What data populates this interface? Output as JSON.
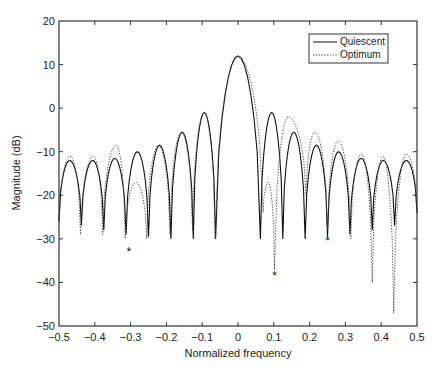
{
  "chart_data": {
    "type": "line",
    "title": "",
    "xlabel": "Normalized frequency",
    "ylabel": "Magnitude (dB)",
    "xlim": [
      -0.5,
      0.5
    ],
    "ylim": [
      -50,
      20
    ],
    "grid": false,
    "legend_position": "upper right",
    "xticks": [
      "−0.5",
      "−0.4",
      "−0.3",
      "−0.2",
      "−0.1",
      "0",
      "0.1",
      "0.2",
      "0.3",
      "0.4",
      "0.5"
    ],
    "yticks": [
      "20",
      "10",
      "0",
      "−10",
      "−20",
      "−30",
      "−40",
      "−50"
    ],
    "series": [
      {
        "name": "Quiescent",
        "style": "solid",
        "nulls": [
          {
            "x": -0.4375,
            "y": -27
          },
          {
            "x": -0.375,
            "y": -28
          },
          {
            "x": -0.3125,
            "y": -29
          },
          {
            "x": -0.25,
            "y": -29.5
          },
          {
            "x": -0.1875,
            "y": -30
          },
          {
            "x": -0.125,
            "y": -30
          },
          {
            "x": -0.0625,
            "y": -30
          },
          {
            "x": 0.0625,
            "y": -30
          },
          {
            "x": 0.125,
            "y": -30
          },
          {
            "x": 0.1875,
            "y": -30
          },
          {
            "x": 0.25,
            "y": -29.5
          },
          {
            "x": 0.3125,
            "y": -29
          },
          {
            "x": 0.375,
            "y": -28
          },
          {
            "x": 0.4375,
            "y": -27
          }
        ],
        "peaks": [
          {
            "x": -0.47,
            "y": -12
          },
          {
            "x": -0.406,
            "y": -12
          },
          {
            "x": -0.344,
            "y": -11.5
          },
          {
            "x": -0.281,
            "y": -10
          },
          {
            "x": -0.219,
            "y": -8.5
          },
          {
            "x": -0.156,
            "y": -5.5
          },
          {
            "x": -0.094,
            "y": -1
          },
          {
            "x": 0.0,
            "y": 12
          },
          {
            "x": 0.094,
            "y": -1
          },
          {
            "x": 0.156,
            "y": -5.5
          },
          {
            "x": 0.219,
            "y": -8.5
          },
          {
            "x": 0.281,
            "y": -10
          },
          {
            "x": 0.344,
            "y": -11.5
          },
          {
            "x": 0.406,
            "y": -12
          },
          {
            "x": 0.47,
            "y": -12
          }
        ]
      },
      {
        "name": "Optimum",
        "style": "dotted",
        "nulls": [
          {
            "x": -0.44,
            "y": -29
          },
          {
            "x": -0.378,
            "y": -29
          },
          {
            "x": -0.315,
            "y": -30
          },
          {
            "x": -0.255,
            "y": -30
          },
          {
            "x": -0.19,
            "y": -29
          },
          {
            "x": -0.127,
            "y": -28
          },
          {
            "x": -0.064,
            "y": -30
          },
          {
            "x": 0.07,
            "y": -24
          },
          {
            "x": 0.102,
            "y": -37
          },
          {
            "x": 0.19,
            "y": -20
          },
          {
            "x": 0.25,
            "y": -28
          },
          {
            "x": 0.315,
            "y": -30
          },
          {
            "x": 0.375,
            "y": -40
          },
          {
            "x": 0.435,
            "y": -47
          }
        ],
        "peaks": [
          {
            "x": -0.468,
            "y": -11
          },
          {
            "x": -0.404,
            "y": -11
          },
          {
            "x": -0.34,
            "y": -8.5
          },
          {
            "x": -0.285,
            "y": -17
          },
          {
            "x": -0.222,
            "y": -8.5
          },
          {
            "x": -0.158,
            "y": -5.5
          },
          {
            "x": -0.094,
            "y": -1
          },
          {
            "x": 0.0,
            "y": 12
          },
          {
            "x": 0.085,
            "y": -17
          },
          {
            "x": 0.14,
            "y": -2
          },
          {
            "x": 0.215,
            "y": -5.5
          },
          {
            "x": 0.28,
            "y": -7.5
          },
          {
            "x": 0.345,
            "y": -10.5
          },
          {
            "x": 0.405,
            "y": -11
          },
          {
            "x": 0.47,
            "y": -10.5
          }
        ]
      }
    ],
    "annotations": [
      {
        "text": "*",
        "x": -0.305,
        "y": -32
      },
      {
        "text": "*",
        "x": 0.102,
        "y": -37.5
      },
      {
        "text": "*",
        "x": 0.25,
        "y": -29.5
      }
    ]
  },
  "legend": {
    "items": [
      {
        "label": "Quiescent",
        "style": "solid"
      },
      {
        "label": "Optimum",
        "style": "dotted"
      }
    ]
  },
  "axes": {
    "xlabel": "Normalized frequency",
    "ylabel": "Magnitude (dB)"
  }
}
